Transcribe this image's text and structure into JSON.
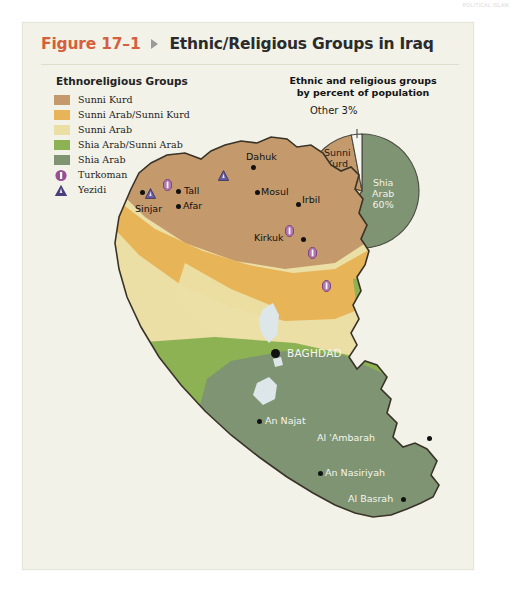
{
  "running_header": "POLITICAL ISLAM",
  "figure": {
    "number": "Figure 17–1",
    "caption": "Ethnic/Religious Groups in Iraq",
    "marker_icon": "triangle-right-icon"
  },
  "legend": {
    "title": "Ethnoreligious Groups",
    "items": [
      {
        "label": "Sunni Kurd",
        "color": "#c49a6c",
        "swatch": "square"
      },
      {
        "label": "Sunni Arab/Sunni Kurd",
        "color": "#e8b458",
        "swatch": "square"
      },
      {
        "label": "Sunni Arab",
        "color": "#ecdfa5",
        "swatch": "square"
      },
      {
        "label": "Shia Arab/Sunni Arab",
        "color": "#8cb253",
        "swatch": "square"
      },
      {
        "label": "Shia Arab",
        "color": "#7e9473",
        "swatch": "square"
      },
      {
        "label": "Turkoman",
        "color": "#9b4f93",
        "swatch": "circle-bar-icon"
      },
      {
        "label": "Yezidi",
        "color": "#4a3f7a",
        "swatch": "triangle-icon"
      }
    ]
  },
  "pie_panel": {
    "title_line1": "Ethnic and religious groups",
    "title_line2": "by percent of population",
    "callout_label": "Other 3%"
  },
  "chart_data": {
    "type": "pie",
    "title": "Ethnic and religious groups by percent of population",
    "categories": [
      "Shia Arab",
      "Sunni Arab",
      "Sunni Kurd",
      "Other"
    ],
    "values": [
      60,
      20,
      17,
      3
    ],
    "labels": [
      "Shia Arab 60%",
      "Sunni Arab 20%",
      "Sunni Kurd 17%",
      "Other 3%"
    ],
    "colors": [
      "#7e9473",
      "#ecdfa5",
      "#c49a6c",
      "#f7f7f2"
    ],
    "legend_position": "inside-slices",
    "units": "percent of population"
  },
  "map": {
    "capital": {
      "name": "BAGHDAD",
      "x": 252,
      "y": 256
    },
    "cities": [
      {
        "name": "Dahuk",
        "lx": 211,
        "ly": 58,
        "dx": 216,
        "dy": 72
      },
      {
        "name": "Tall",
        "lx": 149,
        "ly": 92,
        "dx": 141,
        "dy": 96
      },
      {
        "name": "Afar",
        "lx": 148,
        "ly": 107,
        "dx": 141,
        "dy": 111
      },
      {
        "name": "Sinjar",
        "lx": 100,
        "ly": 110,
        "dx": 105,
        "dy": 97
      },
      {
        "name": "Mosul",
        "lx": 226,
        "ly": 93,
        "dx": 220,
        "dy": 97
      },
      {
        "name": "Irbil",
        "lx": 267,
        "ly": 101,
        "dx": 261,
        "dy": 109
      },
      {
        "name": "Kirkuk",
        "lx": 219,
        "ly": 139,
        "dx": 266,
        "dy": 144
      },
      {
        "name": "An Najat",
        "lx": 230,
        "ly": 322,
        "dx": 222,
        "dy": 326,
        "light": true
      },
      {
        "name": "Al 'Ambarah",
        "lx": 282,
        "ly": 339,
        "dx": 392,
        "dy": 343,
        "light": true
      },
      {
        "name": "An Nasiriyah",
        "lx": 290,
        "ly": 374,
        "dx": 283,
        "dy": 378,
        "light": true
      },
      {
        "name": "Al Basrah",
        "lx": 313,
        "ly": 400,
        "dx": 366,
        "dy": 404,
        "light": true
      }
    ],
    "turkoman_markers": [
      {
        "x": 128,
        "y": 84
      },
      {
        "x": 250,
        "y": 130
      },
      {
        "x": 273,
        "y": 152
      },
      {
        "x": 287,
        "y": 185
      }
    ],
    "yezidi_markers": [
      {
        "x": 110,
        "y": 92
      },
      {
        "x": 183,
        "y": 74
      }
    ]
  }
}
